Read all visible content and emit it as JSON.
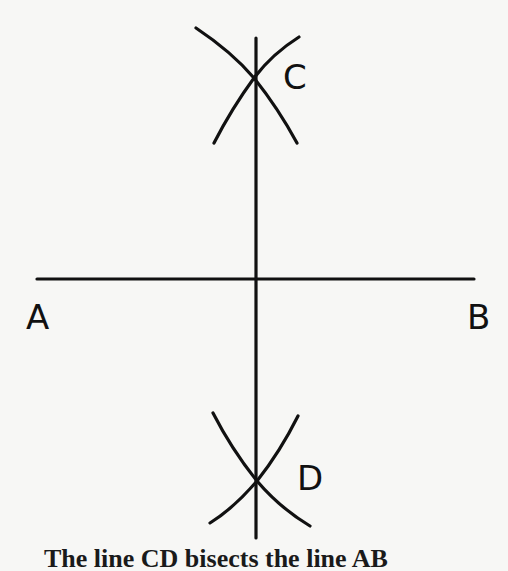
{
  "diagram": {
    "labels": {
      "a": "A",
      "b": "B",
      "c": "C",
      "d": "D"
    },
    "caption": "The line CD bisects the line AB",
    "colors": {
      "background": "#f7f7f5",
      "ink": "#111111"
    },
    "segments": {
      "ab": {
        "x1": 37,
        "y1": 279,
        "x2": 474,
        "y2": 279
      },
      "cd": {
        "x1": 256,
        "y1": 38,
        "x2": 256,
        "y2": 538
      }
    },
    "intersections": {
      "c": {
        "x": 254,
        "y": 78
      },
      "d": {
        "x": 257,
        "y": 481
      }
    }
  }
}
